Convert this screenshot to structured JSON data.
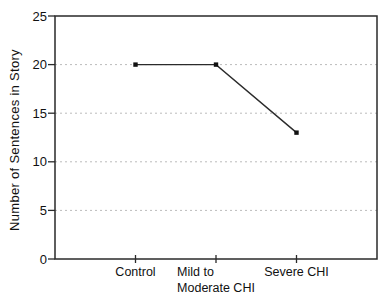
{
  "chart_data": {
    "type": "line",
    "categories": [
      "Control",
      "Mild to Moderate CHI",
      "Severe CHI"
    ],
    "categories_display": [
      [
        "Control"
      ],
      [
        "Mild to",
        "Moderate CHI"
      ],
      [
        "Severe CHI"
      ]
    ],
    "values": [
      20,
      20,
      13
    ],
    "title": "",
    "xlabel": "",
    "ylabel": "Number of Sentences in Story",
    "ylim": [
      0,
      25
    ],
    "yticks": [
      0,
      5,
      10,
      15,
      20,
      25
    ],
    "grid": "horizontal-dotted",
    "legend": "none",
    "marker": "square"
  },
  "colors": {
    "axis": "#2a2a2a",
    "grid": "#bbbbbb",
    "line": "#2b2b2b",
    "marker": "#111111",
    "text": "#111111",
    "background": "#ffffff"
  }
}
